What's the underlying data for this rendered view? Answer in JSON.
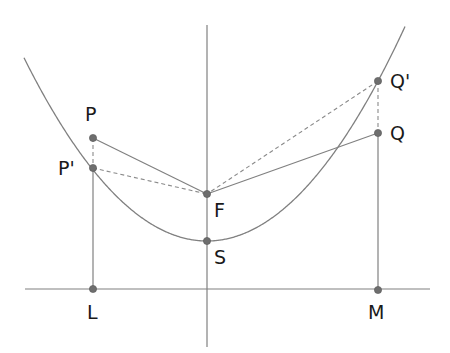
{
  "diagram": {
    "colors": {
      "line": "#808080",
      "point": "#6e6e6e",
      "dashed": "#8a8a8a",
      "text": "#1a1a1a",
      "background": "#ffffff"
    },
    "points": {
      "P": {
        "label": "P",
        "x": 93,
        "y": 138,
        "label_x": 85,
        "label_y": 105
      },
      "P_prime": {
        "label": "P'",
        "x": 93,
        "y": 168,
        "label_x": 58,
        "label_y": 159
      },
      "F": {
        "label": "F",
        "x": 207,
        "y": 194,
        "label_x": 214,
        "label_y": 201
      },
      "S": {
        "label": "S",
        "x": 207,
        "y": 241,
        "label_x": 214,
        "label_y": 248
      },
      "Q": {
        "label": "Q",
        "x": 378,
        "y": 133,
        "label_x": 390,
        "label_y": 124
      },
      "Q_prime": {
        "label": "Q'",
        "x": 378,
        "y": 81,
        "label_x": 390,
        "label_y": 72
      },
      "L": {
        "label": "L",
        "x": 93,
        "y": 289,
        "label_x": 87,
        "label_y": 303
      },
      "M": {
        "label": "M",
        "x": 378,
        "y": 290,
        "label_x": 368,
        "label_y": 303
      }
    },
    "parabola": {
      "vertex_x": 207,
      "vertex_y": 241,
      "a": 0.00547,
      "x_start": 24,
      "x_end": 405
    },
    "axis": {
      "x": 207,
      "y1": 25,
      "y2": 347
    },
    "directrix": {
      "y": 289,
      "x1": 25,
      "x2": 430
    }
  }
}
